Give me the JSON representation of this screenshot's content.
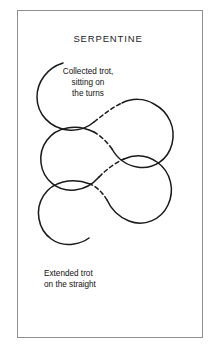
{
  "figure": {
    "title": "SERPENTINE",
    "background_color": "#ffffff",
    "frame_color": "#8e8e8e",
    "stroke_color": "#1a1a1a",
    "text_color": "#111111"
  },
  "annotations": [
    {
      "id": "collected-trot",
      "text": "Collected trot,\nsitting on\nthe turns",
      "align": "center"
    },
    {
      "id": "extended-trot",
      "text": "Extended trot\non the straight",
      "align": "left"
    }
  ],
  "diagram": {
    "type": "serpentine-path",
    "solid_label": "collected trot turns (solid curve)",
    "dashed_label": "extended trot straights (dashed diagonal)",
    "loop_count": 3,
    "stroke_width": 1.5,
    "dash_pattern": "4 3"
  }
}
